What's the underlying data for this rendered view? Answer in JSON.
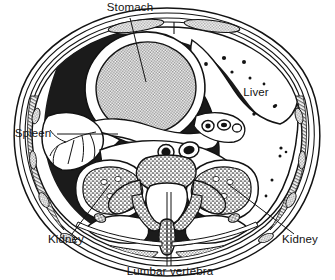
{
  "figure": {
    "type": "anatomical-cross-section",
    "view": "axial / transverse section",
    "background_color": "#ffffff",
    "ink_color": "#131313",
    "fill_colors": {
      "cavity_dark": "#1b1b1b",
      "organ_stipple": "#b9b9b9",
      "muscle_stipple": "#c4c4c4",
      "bone_stipple": "#d2d2d2",
      "white": "#ffffff"
    },
    "labels": [
      {
        "id": "stomach",
        "text": "Stomach",
        "x": 130,
        "y": 11,
        "anchor": "middle"
      },
      {
        "id": "liver",
        "text": "Liver",
        "x": 256,
        "y": 96,
        "anchor": "middle"
      },
      {
        "id": "spleen",
        "text": "Spleen",
        "x": 33,
        "y": 137,
        "anchor": "middle"
      },
      {
        "id": "kidney-left",
        "text": "Kidney",
        "x": 66,
        "y": 243,
        "anchor": "middle"
      },
      {
        "id": "kidney-right",
        "text": "Kidney",
        "x": 300,
        "y": 243,
        "anchor": "middle"
      },
      {
        "id": "lumbar-vertebra",
        "text": "Lumbar vertebra",
        "x": 170,
        "y": 273,
        "anchor": "middle"
      }
    ],
    "structures": [
      {
        "id": "body-wall",
        "name": "abdominal body wall",
        "description": "concentric layered oval: skin, subcutaneous fat, muscle sheets"
      },
      {
        "id": "rectus-muscles",
        "name": "rectus abdominis muscle bellies",
        "description": "paired stippled elongated bundles, anterior wall"
      },
      {
        "id": "peritoneal-cavity",
        "name": "peritoneal cavity / omentum",
        "description": "dark shaded region surrounding viscera"
      },
      {
        "id": "stomach-organ",
        "name": "stomach",
        "description": "large stippled oval with thick white wall, left upper quadrant"
      },
      {
        "id": "liver-organ",
        "name": "liver",
        "description": "large pale region, right side, with scattered vessel dots"
      },
      {
        "id": "spleen-organ",
        "name": "spleen",
        "description": "pale wedge with branching splenic vessels, far left"
      },
      {
        "id": "kidney-left-organ",
        "name": "left kidney",
        "description": "stippled oval with pale calyces"
      },
      {
        "id": "kidney-right-organ",
        "name": "right kidney",
        "description": "stippled oval with pale calyces"
      },
      {
        "id": "aorta",
        "name": "aorta",
        "description": "dark round vessel anterior to vertebral body"
      },
      {
        "id": "vena-cava",
        "name": "inferior vena cava",
        "description": "dark oval vessel anterior to vertebral body"
      },
      {
        "id": "vertebra",
        "name": "lumbar vertebra",
        "description": "stippled bone: body, pedicles, transverse and spinous processes, vertebral canal"
      },
      {
        "id": "back-muscles",
        "name": "posterior back muscles",
        "description": "thin stippled sheets along posterior wall"
      }
    ]
  }
}
